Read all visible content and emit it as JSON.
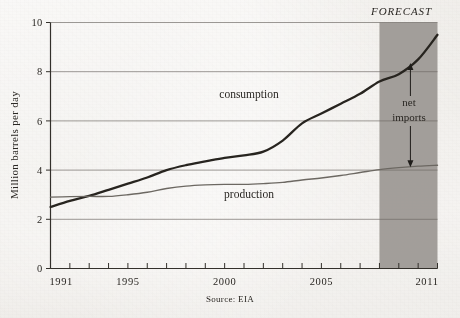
{
  "chart_data": {
    "type": "line",
    "title": "",
    "subtitle": "",
    "xlabel": "",
    "ylabel": "Million barrels per day",
    "xlim": [
      1991,
      2011
    ],
    "ylim": [
      0,
      10
    ],
    "grid": true,
    "legend_position": "inline-annotations",
    "y_ticks": [
      0,
      2,
      4,
      6,
      8,
      10
    ],
    "y_tick_labels": [
      "0",
      "2",
      "4",
      "6",
      "8",
      "10"
    ],
    "x_ticks": [
      1991,
      1992,
      1993,
      1994,
      1995,
      1996,
      1997,
      1998,
      1999,
      2000,
      2001,
      2002,
      2003,
      2004,
      2005,
      2006,
      2007,
      2008,
      2009,
      2010,
      2011
    ],
    "x_tick_labels_shown": [
      "1991",
      "1995",
      "2000",
      "2005",
      "2011"
    ],
    "x": [
      1991,
      1992,
      1993,
      1994,
      1995,
      1996,
      1997,
      1998,
      1999,
      2000,
      2001,
      2002,
      2003,
      2004,
      2005,
      2006,
      2007,
      2008,
      2009,
      2010,
      2011
    ],
    "series": [
      {
        "name": "consumption",
        "color": "#27241f",
        "width": 2.3,
        "values": [
          2.5,
          2.75,
          2.95,
          3.2,
          3.45,
          3.7,
          4.0,
          4.2,
          4.35,
          4.5,
          4.6,
          4.75,
          5.2,
          5.9,
          6.3,
          6.7,
          7.1,
          7.6,
          7.9,
          8.5,
          9.5
        ]
      },
      {
        "name": "production",
        "color": "#6c6862",
        "width": 1.4,
        "values": [
          2.9,
          2.92,
          2.93,
          2.93,
          3.0,
          3.1,
          3.25,
          3.35,
          3.4,
          3.42,
          3.42,
          3.45,
          3.5,
          3.6,
          3.68,
          3.78,
          3.9,
          4.02,
          4.1,
          4.16,
          4.2
        ]
      }
    ],
    "annotations": {
      "forecast_label": "FORECAST",
      "forecast_start_year": 2008,
      "forecast_end_year": 2011,
      "forecast_shade_color": "#9b9792",
      "consumption_label": "consumption",
      "production_label": "production",
      "net_imports_label_line1": "net",
      "net_imports_label_line2": "imports",
      "net_imports_arrow_year": 2009.6,
      "net_imports_arrow_top": 8.35,
      "net_imports_arrow_bottom": 4.12
    },
    "source_note": "Source: EIA"
  }
}
